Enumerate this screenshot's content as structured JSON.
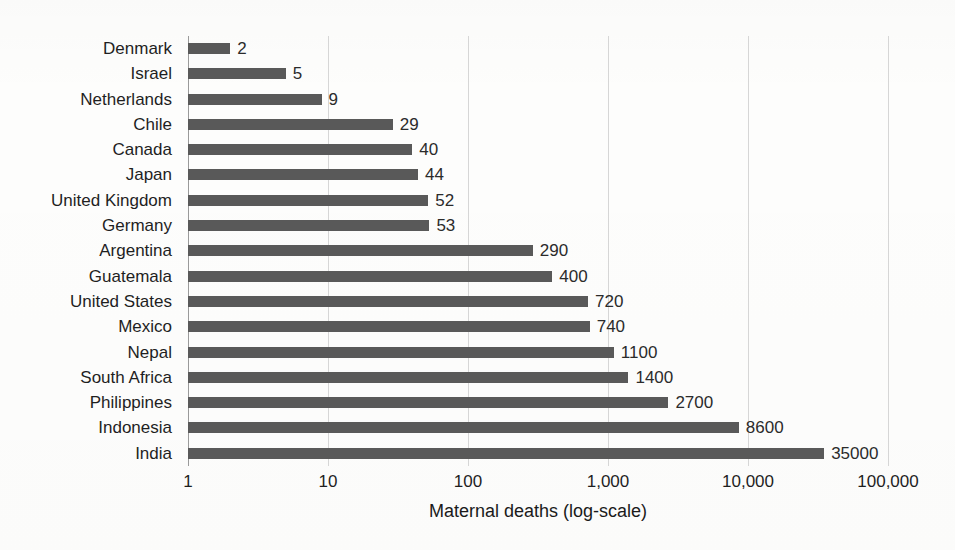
{
  "chart_data": {
    "type": "bar",
    "orientation": "horizontal",
    "title": "",
    "xlabel": "Maternal deaths (log-scale)",
    "ylabel": "",
    "scale": "log10",
    "xlim": [
      1,
      100000
    ],
    "grid": true,
    "legend": false,
    "categories": [
      "Denmark",
      "Israel",
      "Netherlands",
      "Chile",
      "Canada",
      "Japan",
      "United Kingdom",
      "Germany",
      "Argentina",
      "Guatemala",
      "United States",
      "Mexico",
      "Nepal",
      "South Africa",
      "Philippines",
      "Indonesia",
      "India"
    ],
    "values": [
      2,
      5,
      9,
      29,
      40,
      44,
      52,
      53,
      290,
      400,
      720,
      740,
      1100,
      1400,
      2700,
      8600,
      35000
    ],
    "value_labels": [
      "2",
      "5",
      "9",
      "29",
      "40",
      "44",
      "52",
      "53",
      "290",
      "400",
      "720",
      "740",
      "1100",
      "1400",
      "2700",
      "8600",
      "35000"
    ],
    "xticks": [
      1,
      10,
      100,
      1000,
      10000,
      100000
    ],
    "xtick_labels": [
      "1",
      "10",
      "100",
      "1,000",
      "10,000",
      "100,000"
    ],
    "bar_color": "#595959",
    "gridline_color": "#d6d6d6",
    "axis_color": "#9a9a9a",
    "background_color": "#fdfdfc"
  }
}
